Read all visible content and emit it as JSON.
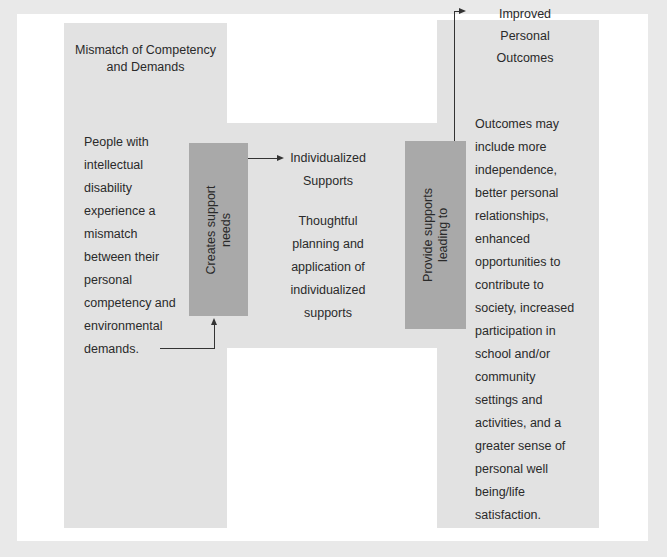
{
  "colors": {
    "background": "#e9e9e9",
    "panel": "#ffffff",
    "shape": "#e2e2e2",
    "box": "#a9a9a9",
    "text": "#2a2a2a"
  },
  "left": {
    "title_line1": "Mismatch of Competency",
    "title_line2": "and Demands",
    "body": [
      "People with",
      "intellectual",
      "disability",
      "experience a",
      "mismatch",
      "between their",
      "personal",
      "competency and",
      "environmental",
      "demands."
    ]
  },
  "box1": {
    "line1": "Creates support",
    "line2": "needs"
  },
  "middle": {
    "title_line1": "Individualized",
    "title_line2": "Supports",
    "body": [
      "Thoughtful",
      "planning and",
      "application of",
      "individualized",
      "supports"
    ]
  },
  "box2": {
    "line1": "Provide supports",
    "line2": "leading to"
  },
  "right": {
    "title": [
      "Improved",
      "Personal",
      "Outcomes"
    ],
    "body": [
      "Outcomes may",
      "include more",
      "independence,",
      "better personal",
      "relationships,",
      "enhanced",
      "opportunities to",
      "contribute to",
      "society, increased",
      "participation in",
      "school and/or",
      "community",
      "settings and",
      "activities, and a",
      "greater sense of",
      "personal well",
      "being/life",
      "satisfaction."
    ]
  }
}
